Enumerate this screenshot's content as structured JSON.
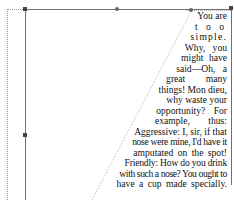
{
  "editor": {
    "text_frame": {
      "shape": "trapezoid-wrap",
      "lines": [
        "You are",
        "t  o  o",
        "simple.",
        "Why, you",
        "might have",
        "said—Oh, a",
        "great many",
        "things! Mon dieu,",
        "why waste your",
        "opportunity? For",
        "example, thus:",
        "Aggressive: I, sir, if that",
        "nose were mine, I'd have it",
        "amputated on the spot!",
        "Friendly: How do you drink",
        "with such a nose? You ought to",
        "have a cup made specially."
      ]
    },
    "handles": [
      "top-left",
      "top-middle",
      "top-right",
      "middle-left",
      "top-right-inner"
    ],
    "colors": {
      "frame_line": "#6f6f6f",
      "guide_dotted": "#9a9a9a",
      "text": "#111111",
      "background": "#ffffff"
    }
  }
}
